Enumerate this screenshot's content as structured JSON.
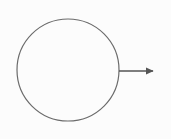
{
  "diagram": {
    "circle": {
      "cx": 68,
      "cy": 70,
      "r": 51,
      "stroke": "#6b6b6b",
      "stroke_width": 1.2,
      "fill": "none"
    },
    "arrow": {
      "x1": 119,
      "y1": 71,
      "x2": 153,
      "y2": 71,
      "stroke": "#555555",
      "stroke_width": 1.4,
      "direction": "right",
      "head_icon": "arrowhead-icon"
    },
    "colors": {
      "background": "#fcfcfc",
      "line": "#6b6b6b"
    }
  }
}
